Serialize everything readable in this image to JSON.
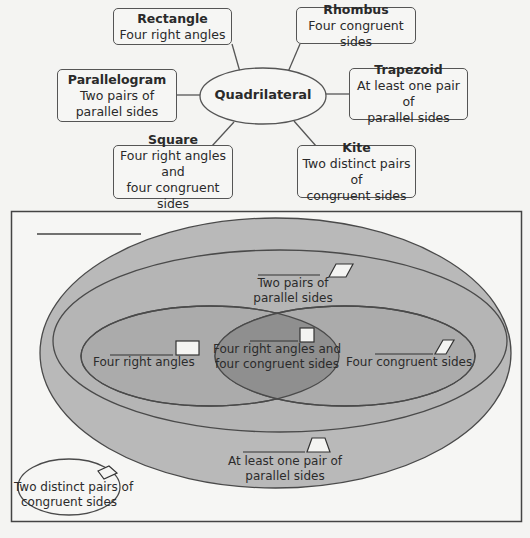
{
  "concept_map": {
    "center": "Quadrilateral",
    "nodes": [
      {
        "id": "rectangle",
        "title": "Rectangle",
        "lines": [
          "Four right angles"
        ]
      },
      {
        "id": "rhombus",
        "title": "Rhombus",
        "lines": [
          "Four congruent sides"
        ]
      },
      {
        "id": "parallelogram",
        "title": "Parallelogram",
        "lines": [
          "Two pairs of",
          "parallel sides"
        ]
      },
      {
        "id": "trapezoid",
        "title": "Trapezoid",
        "lines": [
          "At least one pair of",
          "parallel sides"
        ]
      },
      {
        "id": "square",
        "title": "Square",
        "lines": [
          "Four right angles and",
          "four congruent sides"
        ]
      },
      {
        "id": "kite",
        "title": "Kite",
        "lines": [
          "Two distinct pairs of",
          "congruent sides"
        ]
      }
    ]
  },
  "venn": {
    "title_blank": "",
    "regions": {
      "trapezoid": {
        "blank": "",
        "lines": [
          "At least one pair of",
          "parallel sides"
        ],
        "shape": "trapezoid-icon"
      },
      "parallelogram": {
        "blank": "",
        "lines": [
          "Two pairs",
          "of parallel sides"
        ],
        "shape": "parallelogram-icon"
      },
      "rectangle": {
        "blank": "",
        "lines": [
          "Four right angles"
        ],
        "shape": "rectangle-icon"
      },
      "rhombus": {
        "blank": "",
        "lines": [
          "Four congruent sides"
        ],
        "shape": "rhombus-icon"
      },
      "square": {
        "blank": "",
        "lines": [
          "Four right angles and",
          "four congruent sides"
        ],
        "shape": "square-icon"
      },
      "kite": {
        "blank": "",
        "lines": [
          "Two distinct pairs of",
          "congruent sides"
        ],
        "shape": "kite-icon"
      }
    }
  },
  "colors": {
    "background": "#f4f4f2",
    "outer_fill": "#b9b9b9",
    "middle_fill": "#b4b4b4",
    "inner_fill": "#a9a9a9",
    "overlap_fill": "#8e8e8e",
    "stroke": "#4a4a4a"
  }
}
